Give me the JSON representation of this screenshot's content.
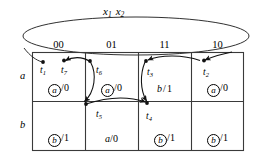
{
  "figure": {
    "type": "state-transition-flow-table",
    "input_caption": {
      "var1": "x",
      "sub1": "1",
      "var2": "x",
      "sub2": "2"
    },
    "columns": [
      "00",
      "01",
      "11",
      "10"
    ],
    "rows": [
      "a",
      "b"
    ],
    "cells": [
      [
        {
          "next_state": "a",
          "stable": true,
          "output": "0",
          "text": "a/0"
        },
        {
          "next_state": "a",
          "stable": true,
          "output": "0",
          "text": "a/0"
        },
        {
          "next_state": "b",
          "stable": false,
          "output": "1",
          "text": "b/1"
        },
        {
          "next_state": "a",
          "stable": true,
          "output": "0",
          "text": "a/0"
        }
      ],
      [
        {
          "next_state": "b",
          "stable": true,
          "output": "1",
          "text": "b/1"
        },
        {
          "next_state": "a",
          "stable": false,
          "output": "0",
          "text": "a/0"
        },
        {
          "next_state": "b",
          "stable": true,
          "output": "1",
          "text": "b/1"
        },
        {
          "next_state": "b",
          "stable": true,
          "output": "1",
          "text": "b/1"
        }
      ]
    ],
    "transitions": [
      {
        "id": "t1",
        "label": "t",
        "sub": "1"
      },
      {
        "id": "t2",
        "label": "t",
        "sub": "2"
      },
      {
        "id": "t3",
        "label": "t",
        "sub": "3"
      },
      {
        "id": "t4",
        "label": "t",
        "sub": "4"
      },
      {
        "id": "t5",
        "label": "t",
        "sub": "5"
      },
      {
        "id": "t6",
        "label": "t",
        "sub": "6"
      },
      {
        "id": "t7",
        "label": "t",
        "sub": "7"
      }
    ],
    "outputs": {
      "zero": "0",
      "one": "1"
    },
    "slash": "/",
    "colors": {
      "ink": "#000000",
      "paper": "#ffffff",
      "rule": "#3a3a3a"
    }
  }
}
